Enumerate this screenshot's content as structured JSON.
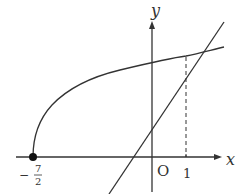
{
  "diagram": {
    "title": "",
    "axes": {
      "x_label": "x",
      "y_label": "y",
      "origin_label": "O"
    },
    "ticks": {
      "x_tick_1": "1",
      "x_tick_neg_num": "7",
      "x_tick_neg_den": "2",
      "x_tick_neg_sign": "−"
    },
    "curves": [
      {
        "name": "radical curve",
        "equation": "y = sqrt(2x + 7)",
        "start_point": [
          -3.5,
          0
        ]
      },
      {
        "name": "line",
        "equation": "y = x + 2"
      }
    ],
    "intersection": {
      "x": 1,
      "y": 3
    },
    "colors": {
      "stroke": "#333333",
      "background": "#ffffff"
    }
  }
}
